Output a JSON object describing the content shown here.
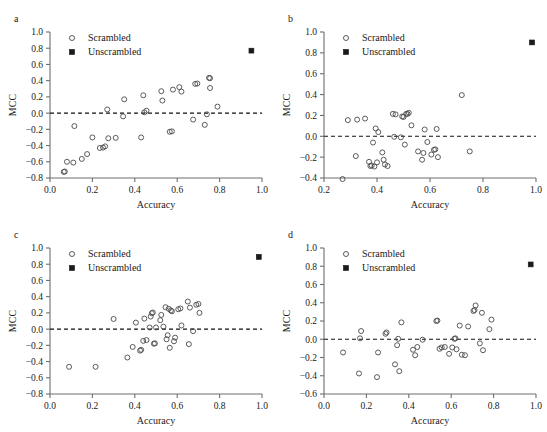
{
  "figure": {
    "panel_count": 4,
    "marker_open_color": "#4a4a4a",
    "marker_filled_color": "#1a1a1a",
    "axis_color": "#6e6e6e",
    "zero_line_color": "#111111"
  },
  "legend": {
    "scrambled_label": "Scrambled",
    "unscrambled_label": "Unscrambled",
    "scrambled_marker": "open-circle",
    "unscrambled_marker": "filled-square"
  },
  "panels": [
    {
      "letter": "a"
    },
    {
      "letter": "b"
    },
    {
      "letter": "c"
    },
    {
      "letter": "d"
    }
  ],
  "chart_data": [
    {
      "type": "scatter",
      "panel": "a",
      "title": "",
      "xlabel": "Accuracy",
      "ylabel": "MCC",
      "xlim": [
        0.0,
        1.0
      ],
      "ylim": [
        -0.8,
        1.0
      ],
      "xticks": [
        0.0,
        0.2,
        0.4,
        0.6,
        0.8,
        1.0
      ],
      "xticklabels": [
        "0.0",
        "0.2",
        "0.4",
        "0.6",
        "0.8",
        "1.0"
      ],
      "yticks": [
        -0.8,
        -0.6,
        -0.4,
        -0.2,
        0.0,
        0.2,
        0.4,
        0.6,
        0.8,
        1.0
      ],
      "yticklabels": [
        "−0.8",
        "−0.6",
        "−0.4",
        "−0.2",
        "0.0",
        "0.2",
        "0.4",
        "0.6",
        "0.8",
        "1.0"
      ],
      "grid": false,
      "legend_position": "upper-left",
      "annotations": [
        "dashed horizontal reference line at MCC = 0"
      ],
      "series": [
        {
          "name": "Scrambled",
          "marker": "open-circle",
          "points": [
            [
              0.065,
              -0.725
            ],
            [
              0.07,
              -0.72
            ],
            [
              0.08,
              -0.6
            ],
            [
              0.11,
              -0.61
            ],
            [
              0.115,
              -0.16
            ],
            [
              0.15,
              -0.565
            ],
            [
              0.175,
              -0.505
            ],
            [
              0.2,
              -0.3
            ],
            [
              0.235,
              -0.43
            ],
            [
              0.25,
              -0.425
            ],
            [
              0.26,
              -0.41
            ],
            [
              0.27,
              0.045
            ],
            [
              0.275,
              -0.31
            ],
            [
              0.31,
              -0.305
            ],
            [
              0.345,
              -0.04
            ],
            [
              0.35,
              0.17
            ],
            [
              0.43,
              -0.3
            ],
            [
              0.44,
              0.22
            ],
            [
              0.445,
              0.01
            ],
            [
              0.455,
              0.03
            ],
            [
              0.525,
              0.27
            ],
            [
              0.53,
              0.155
            ],
            [
              0.565,
              -0.23
            ],
            [
              0.575,
              -0.225
            ],
            [
              0.58,
              0.29
            ],
            [
              0.61,
              0.32
            ],
            [
              0.62,
              0.265
            ],
            [
              0.675,
              -0.08
            ],
            [
              0.685,
              0.36
            ],
            [
              0.695,
              0.365
            ],
            [
              0.73,
              -0.145
            ],
            [
              0.74,
              -0.015
            ],
            [
              0.75,
              0.435
            ],
            [
              0.755,
              0.43
            ],
            [
              0.755,
              0.31
            ],
            [
              0.79,
              0.08
            ]
          ]
        },
        {
          "name": "Unscrambled",
          "marker": "filled-square",
          "points": [
            [
              0.95,
              0.77
            ]
          ]
        }
      ]
    },
    {
      "type": "scatter",
      "panel": "b",
      "title": "",
      "xlabel": "Accuracy",
      "ylabel": "MCC",
      "xlim": [
        0.2,
        1.0
      ],
      "ylim": [
        -0.4,
        1.0
      ],
      "xticks": [
        0.2,
        0.4,
        0.6,
        0.8,
        1.0
      ],
      "xticklabels": [
        "0.2",
        "0.4",
        "0.6",
        "0.8",
        "1.0"
      ],
      "yticks": [
        -0.4,
        -0.2,
        0.0,
        0.2,
        0.4,
        0.6,
        0.8,
        1.0
      ],
      "yticklabels": [
        "−0.4",
        "−0.2",
        "0.0",
        "0.2",
        "0.4",
        "0.6",
        "0.8",
        "1.0"
      ],
      "grid": false,
      "legend_position": "upper-left",
      "annotations": [
        "dashed horizontal reference line at MCC = 0"
      ],
      "series": [
        {
          "name": "Scrambled",
          "marker": "open-circle",
          "points": [
            [
              0.27,
              -0.41
            ],
            [
              0.29,
              0.155
            ],
            [
              0.32,
              -0.19
            ],
            [
              0.325,
              0.16
            ],
            [
              0.355,
              0.17
            ],
            [
              0.37,
              -0.245
            ],
            [
              0.375,
              -0.285
            ],
            [
              0.38,
              -0.28
            ],
            [
              0.385,
              -0.06
            ],
            [
              0.39,
              -0.29
            ],
            [
              0.395,
              0.075
            ],
            [
              0.4,
              -0.25
            ],
            [
              0.405,
              0.04
            ],
            [
              0.42,
              -0.155
            ],
            [
              0.425,
              -0.225
            ],
            [
              0.43,
              -0.27
            ],
            [
              0.44,
              -0.285
            ],
            [
              0.46,
              0.215
            ],
            [
              0.465,
              -0.005
            ],
            [
              0.47,
              0.21
            ],
            [
              0.49,
              -0.01
            ],
            [
              0.495,
              0.19
            ],
            [
              0.5,
              0.185
            ],
            [
              0.505,
              -0.08
            ],
            [
              0.51,
              0.215
            ],
            [
              0.515,
              0.215
            ],
            [
              0.52,
              0.225
            ],
            [
              0.53,
              0.105
            ],
            [
              0.555,
              -0.145
            ],
            [
              0.57,
              -0.225
            ],
            [
              0.575,
              -0.16
            ],
            [
              0.58,
              0.065
            ],
            [
              0.59,
              -0.055
            ],
            [
              0.605,
              -0.175
            ],
            [
              0.615,
              -0.13
            ],
            [
              0.62,
              -0.125
            ],
            [
              0.625,
              0.07
            ],
            [
              0.63,
              -0.2
            ],
            [
              0.72,
              0.395
            ],
            [
              0.75,
              -0.145
            ]
          ]
        },
        {
          "name": "Unscrambled",
          "marker": "filled-square",
          "points": [
            [
              0.985,
              0.9
            ]
          ]
        }
      ]
    },
    {
      "type": "scatter",
      "panel": "c",
      "title": "",
      "xlabel": "Accuracy",
      "ylabel": "MCC",
      "xlim": [
        0.0,
        1.0
      ],
      "ylim": [
        -0.8,
        1.0
      ],
      "xticks": [
        0.0,
        0.2,
        0.4,
        0.6,
        0.8,
        1.0
      ],
      "xticklabels": [
        "0.0",
        "0.2",
        "0.4",
        "0.6",
        "0.8",
        "1.0"
      ],
      "yticks": [
        -0.8,
        -0.6,
        -0.4,
        -0.2,
        0.0,
        0.2,
        0.4,
        0.6,
        0.8,
        1.0
      ],
      "yticklabels": [
        "−0.8",
        "−0.6",
        "−0.4",
        "−0.2",
        "0.0",
        "0.2",
        "0.4",
        "0.6",
        "0.8",
        "1.0"
      ],
      "grid": false,
      "legend_position": "upper-left",
      "annotations": [
        "dashed horizontal reference line at MCC = 0"
      ],
      "series": [
        {
          "name": "Scrambled",
          "marker": "open-circle",
          "points": [
            [
              0.09,
              -0.465
            ],
            [
              0.215,
              -0.465
            ],
            [
              0.3,
              0.125
            ],
            [
              0.365,
              -0.35
            ],
            [
              0.39,
              -0.22
            ],
            [
              0.405,
              0.08
            ],
            [
              0.425,
              -0.265
            ],
            [
              0.43,
              -0.255
            ],
            [
              0.44,
              -0.145
            ],
            [
              0.445,
              0.13
            ],
            [
              0.455,
              -0.135
            ],
            [
              0.47,
              0.02
            ],
            [
              0.475,
              0.155
            ],
            [
              0.48,
              0.195
            ],
            [
              0.485,
              0.205
            ],
            [
              0.49,
              -0.18
            ],
            [
              0.495,
              -0.175
            ],
            [
              0.5,
              0.02
            ],
            [
              0.52,
              0.11
            ],
            [
              0.525,
              0.175
            ],
            [
              0.535,
              0.03
            ],
            [
              0.545,
              0.27
            ],
            [
              0.55,
              -0.125
            ],
            [
              0.555,
              -0.075
            ],
            [
              0.56,
              0.25
            ],
            [
              0.565,
              -0.23
            ],
            [
              0.57,
              0.23
            ],
            [
              0.575,
              0.22
            ],
            [
              0.585,
              -0.15
            ],
            [
              0.59,
              -0.105
            ],
            [
              0.605,
              0.245
            ],
            [
              0.615,
              0.255
            ],
            [
              0.62,
              0.045
            ],
            [
              0.65,
              0.34
            ],
            [
              0.655,
              -0.185
            ],
            [
              0.66,
              0.265
            ],
            [
              0.675,
              -0.025
            ],
            [
              0.69,
              0.3
            ],
            [
              0.7,
              0.31
            ],
            [
              0.705,
              0.2
            ]
          ]
        },
        {
          "name": "Unscrambled",
          "marker": "filled-square",
          "points": [
            [
              0.985,
              0.89
            ]
          ]
        }
      ]
    },
    {
      "type": "scatter",
      "panel": "d",
      "title": "",
      "xlabel": "Accuracy",
      "ylabel": "MCC",
      "xlim": [
        0.0,
        1.0
      ],
      "ylim": [
        -0.6,
        1.0
      ],
      "xticks": [
        0.0,
        0.2,
        0.4,
        0.6,
        0.8,
        1.0
      ],
      "xticklabels": [
        "0.0",
        "0.2",
        "0.4",
        "0.6",
        "0.8",
        "1.0"
      ],
      "yticks": [
        -0.6,
        -0.4,
        -0.2,
        0.0,
        0.2,
        0.4,
        0.6,
        0.8,
        1.0
      ],
      "yticklabels": [
        "−0.6",
        "−0.4",
        "−0.2",
        "0.0",
        "0.2",
        "0.4",
        "0.6",
        "0.8",
        "1.0"
      ],
      "grid": false,
      "legend_position": "upper-left",
      "annotations": [
        "dashed horizontal reference line at MCC = 0"
      ],
      "series": [
        {
          "name": "Scrambled",
          "marker": "open-circle",
          "points": [
            [
              0.09,
              -0.145
            ],
            [
              0.165,
              -0.375
            ],
            [
              0.17,
              0.01
            ],
            [
              0.175,
              0.09
            ],
            [
              0.25,
              -0.415
            ],
            [
              0.255,
              -0.145
            ],
            [
              0.29,
              0.06
            ],
            [
              0.295,
              0.075
            ],
            [
              0.335,
              -0.275
            ],
            [
              0.345,
              -0.065
            ],
            [
              0.35,
              0.005
            ],
            [
              0.355,
              -0.35
            ],
            [
              0.365,
              0.185
            ],
            [
              0.42,
              -0.115
            ],
            [
              0.43,
              -0.175
            ],
            [
              0.44,
              -0.085
            ],
            [
              0.465,
              -0.005
            ],
            [
              0.53,
              0.2
            ],
            [
              0.535,
              0.205
            ],
            [
              0.545,
              -0.105
            ],
            [
              0.555,
              -0.09
            ],
            [
              0.57,
              -0.085
            ],
            [
              0.59,
              -0.16
            ],
            [
              0.605,
              -0.09
            ],
            [
              0.615,
              0.005
            ],
            [
              0.62,
              0.01
            ],
            [
              0.625,
              -0.11
            ],
            [
              0.64,
              0.15
            ],
            [
              0.65,
              -0.17
            ],
            [
              0.665,
              -0.175
            ],
            [
              0.68,
              0.14
            ],
            [
              0.705,
              0.31
            ],
            [
              0.71,
              0.32
            ],
            [
              0.715,
              0.37
            ],
            [
              0.735,
              -0.045
            ],
            [
              0.745,
              0.29
            ],
            [
              0.75,
              -0.12
            ],
            [
              0.78,
              0.11
            ],
            [
              0.79,
              0.215
            ]
          ]
        },
        {
          "name": "Unscrambled",
          "marker": "filled-square",
          "points": [
            [
              0.975,
              0.82
            ]
          ]
        }
      ]
    }
  ]
}
